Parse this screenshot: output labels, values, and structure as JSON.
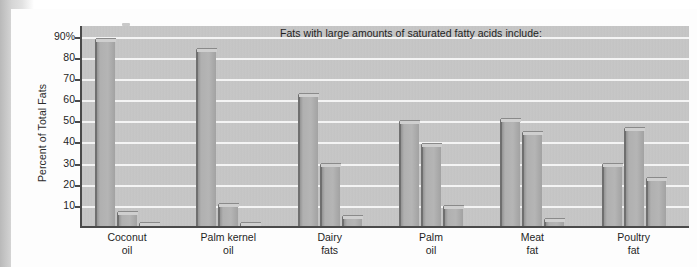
{
  "figure": {
    "y_axis_title": "Percent of Total Fats",
    "title": "Fats with large amounts of saturated fatty acids include:"
  },
  "chart_data": {
    "type": "bar",
    "title": "Fats with large amounts of saturated fatty acids include:",
    "xlabel": "",
    "ylabel": "Percent of Total Fats",
    "ylim": [
      0,
      95
    ],
    "grid": true,
    "legend": "none",
    "categories": [
      "Coconut\noil",
      "Palm kernel\noil",
      "Dairy\nfats",
      "Palm\noil",
      "Meat\nfat",
      "Poultry\nfat"
    ],
    "ytick_labels": [
      "90%",
      "80",
      "70",
      "60",
      "50",
      "40",
      "30",
      "20",
      "10"
    ],
    "ytick_values": [
      90,
      80,
      70,
      60,
      50,
      40,
      30,
      20,
      10
    ],
    "series": [
      {
        "name": "Saturated fat",
        "values": [
          89,
          84,
          63,
          50,
          51,
          30
        ]
      },
      {
        "name": "Monounsaturated fat",
        "values": [
          7,
          11,
          30,
          39,
          45,
          47
        ]
      },
      {
        "name": "Polyunsaturated fat",
        "values": [
          2,
          2,
          5,
          10,
          4,
          23
        ]
      }
    ],
    "colors": {
      "plot_background": "#c8c8c8",
      "bar_fill": "#a8a8a8",
      "bar_edge": "#6f6f6f",
      "gridline": "#f4f4f4",
      "axis": "#4a4a4a",
      "text": "#1f1f1f"
    }
  }
}
